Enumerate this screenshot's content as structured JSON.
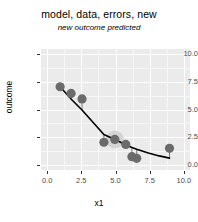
{
  "chart_data": {
    "type": "scatter",
    "title": "model, data, errors, new",
    "subtitle": "new outcome predicted",
    "xlabel": "x1",
    "ylabel": "outcome",
    "xlim": [
      -0.45,
      10.45
    ],
    "ylim": [
      -0.45,
      10.45
    ],
    "xticks": [
      0.0,
      2.5,
      5.0,
      7.5,
      10.0
    ],
    "yticks": [
      0.0,
      2.5,
      5.0,
      7.5,
      10.0
    ],
    "xtick_labels": [
      "0.0",
      "2.5",
      "5.0",
      "7.5",
      "10.0"
    ],
    "ytick_labels": [
      "0.0",
      "2.5",
      "5.0",
      "7.5",
      "10.0"
    ],
    "grid": true,
    "grid_major_color": "#ffffff",
    "grid_minor_color": "#f7f7f7",
    "panel_background": "#ebebeb",
    "legend": "none",
    "series": [
      {
        "name": "data",
        "type": "points",
        "color": "#6b6b6b",
        "point_size": 4.6,
        "x": [
          0.95,
          1.75,
          2.55,
          4.15,
          4.95,
          5.75,
          6.2,
          6.55,
          8.95
        ],
        "y": [
          7.05,
          6.45,
          5.95,
          2.05,
          2.3,
          1.85,
          0.75,
          0.6,
          1.5
        ]
      },
      {
        "name": "new outcome predicted",
        "type": "highlight-point",
        "color": "#d4d4d4",
        "point_size": 9.0,
        "x": [
          4.95
        ],
        "y": [
          2.3
        ]
      },
      {
        "name": "model fit",
        "type": "line",
        "color": "#000000",
        "width": 1.6,
        "x": [
          0.95,
          1.75,
          2.55,
          3.35,
          4.15,
          4.95,
          5.75,
          6.2,
          6.55,
          7.4,
          8.2,
          8.95
        ],
        "y": [
          7.05,
          5.95,
          4.95,
          3.85,
          2.75,
          2.3,
          1.82,
          1.58,
          1.42,
          1.08,
          0.82,
          0.62
        ]
      },
      {
        "name": "errors",
        "type": "residual-segments",
        "color": "#7a7a7a",
        "width": 1.0,
        "segments": [
          {
            "x": 1.75,
            "y0": 6.45,
            "y1": 5.95
          },
          {
            "x": 2.55,
            "y0": 5.95,
            "y1": 4.95
          },
          {
            "x": 4.15,
            "y0": 2.05,
            "y1": 2.75
          },
          {
            "x": 5.75,
            "y0": 1.85,
            "y1": 1.82
          },
          {
            "x": 6.2,
            "y0": 0.75,
            "y1": 1.58
          },
          {
            "x": 6.55,
            "y0": 0.6,
            "y1": 1.42
          },
          {
            "x": 8.95,
            "y0": 1.5,
            "y1": 0.62
          }
        ]
      }
    ]
  }
}
